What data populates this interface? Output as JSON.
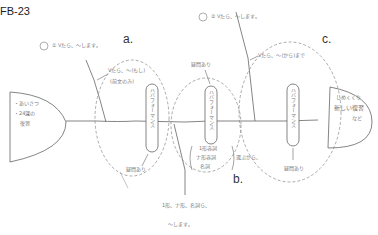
{
  "figure_id": "FB-23",
  "diagram_type": "fishbone",
  "head_left": {
    "lines": [
      "・あいさつ",
      "・24課の",
      "復習"
    ]
  },
  "tail_right": {
    "lines": [
      "しめくくり",
      "新しい復習",
      "など"
    ]
  },
  "top_labels": {
    "one": "① Vたら、〜します。",
    "two": "② Vたら、〜します。"
  },
  "section_letters": {
    "a": "a.",
    "b": "b.",
    "c": "c."
  },
  "branch_a": {
    "line1": "Vたら、〜(もし)",
    "line2": "(前文のみ)",
    "oval": "ハバフォーマンス",
    "question": "疑問あり"
  },
  "branch_b": {
    "question": "疑問あり",
    "oval": "ハバフォーマンス",
    "list": [
      "1形容詞",
      "ナ形容詞",
      "名詞"
    ],
    "choose": "選ぶから、"
  },
  "branch_c": {
    "line1": "Vたら、〜(から)まで",
    "oval": "ハバフォーマンス",
    "question": "疑問あり"
  },
  "bottom": {
    "line1": "1形、ナ形、名詞ら、",
    "line2": "〜します。"
  }
}
